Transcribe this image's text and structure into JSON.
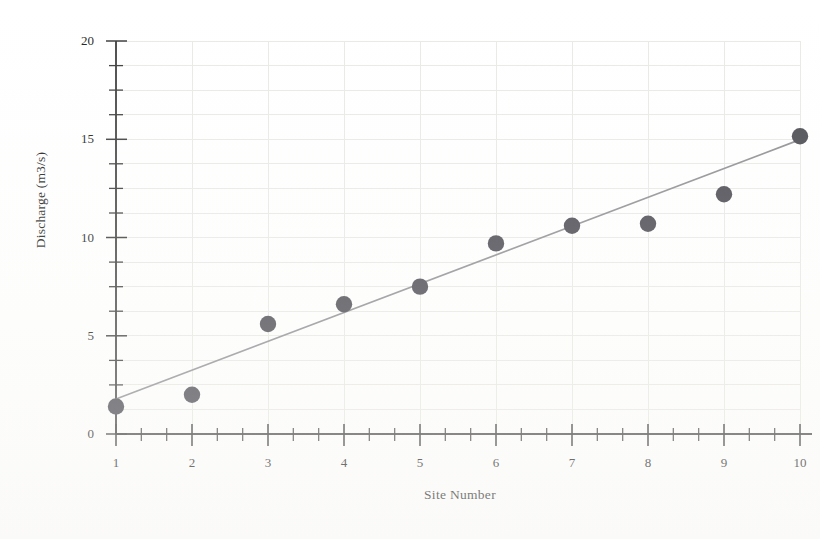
{
  "chart_data": {
    "type": "scatter",
    "title": "",
    "xlabel": "Site Number",
    "ylabel": "Discharge (m3/s)",
    "x": [
      1,
      2,
      3,
      4,
      5,
      6,
      7,
      8,
      9,
      10
    ],
    "values": [
      1.4,
      2.0,
      5.6,
      6.6,
      7.5,
      9.7,
      10.6,
      10.7,
      12.2,
      15.15
    ],
    "series": [
      {
        "name": "Discharge",
        "marker": "filled-circle",
        "color": "#4a4a52",
        "values": [
          1.4,
          2.0,
          5.6,
          6.6,
          7.5,
          9.7,
          10.6,
          10.7,
          12.2,
          15.15
        ]
      },
      {
        "name": "Trend line",
        "type": "line",
        "color": "#8f8f93",
        "endpoints": [
          [
            1.0,
            1.78
          ],
          [
            10.0,
            14.98
          ]
        ]
      }
    ],
    "xlim": [
      1,
      10
    ],
    "ylim": [
      0,
      20
    ],
    "xticks": [
      1,
      2,
      3,
      4,
      5,
      6,
      7,
      8,
      9,
      10
    ],
    "xtick_labels": [
      "1",
      "2",
      "3",
      "4",
      "5",
      "6",
      "7",
      "8",
      "9",
      "10"
    ],
    "yticks": [
      0,
      5,
      10,
      15,
      20
    ],
    "ytick_labels": [
      "0",
      "5",
      "10",
      "15",
      "20"
    ],
    "y_minor_interval": 1.25,
    "x_minor_count_between_majors": 2,
    "grid": true,
    "grid_color": "#e9e9e6",
    "legend": "none",
    "axis_color": "#4b4b4b"
  },
  "axes": {
    "y_title": "Discharge (m3/s)",
    "x_title": "Site Number"
  }
}
